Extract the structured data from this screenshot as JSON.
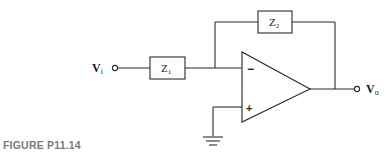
{
  "figure": {
    "caption": "FIGURE P11.14",
    "type": "inverting op-amp circuit with impedances"
  },
  "components": {
    "input_label": "V",
    "input_subscript": "i",
    "output_label": "V",
    "output_subscript": "o",
    "z1": {
      "label": "Z",
      "subscript": "1"
    },
    "z2": {
      "label": "Z",
      "subscript": "2"
    },
    "opamp": {
      "inverting_sign": "−",
      "noninverting_sign": "+"
    },
    "ground": "ground"
  },
  "colors": {
    "line": "#2a2a2a",
    "caption": "#7a7a7a",
    "background": "#ffffff"
  }
}
